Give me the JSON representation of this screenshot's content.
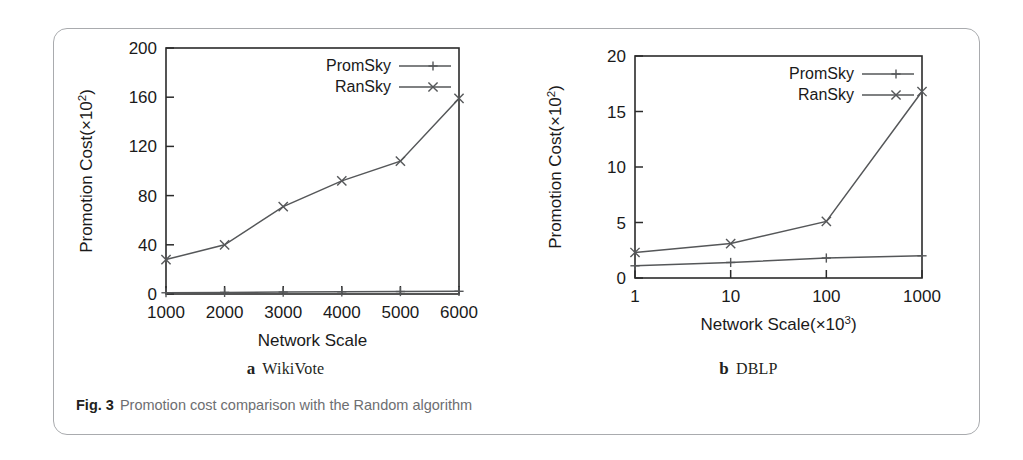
{
  "figure": {
    "caption_number": "Fig. 3",
    "caption_text": "Promotion cost comparison with the Random algorithm"
  },
  "panels": [
    {
      "sub_label": "a",
      "sub_name": "WikiVote"
    },
    {
      "sub_label": "b",
      "sub_name": "DBLP"
    }
  ],
  "chart_data": [
    {
      "type": "line",
      "title": "",
      "subfigure_label": "a",
      "subfigure_name": "WikiVote",
      "xlabel": "Network Scale",
      "ylabel": "Promotion Cost(×10²)",
      "ylabel_base": "Promotion Cost(×10",
      "ylabel_exp": "2",
      "ylabel_tail": ")",
      "x": [
        1000,
        2000,
        3000,
        4000,
        5000,
        6000
      ],
      "xticklabels": [
        "1000",
        "2000",
        "3000",
        "4000",
        "5000",
        "6000"
      ],
      "yticks": [
        0,
        40,
        80,
        120,
        160,
        200
      ],
      "yticklabels": [
        "0",
        "40",
        "80",
        "120",
        "160",
        "200"
      ],
      "xlim": [
        1000,
        6000
      ],
      "ylim": [
        0,
        200
      ],
      "grid": false,
      "legend_position": "top-right",
      "series": [
        {
          "name": "PromSky",
          "marker": "plus",
          "color": "#555759",
          "values": [
            1.0,
            1.3,
            1.6,
            1.8,
            2.0,
            2.2
          ]
        },
        {
          "name": "RanSky",
          "marker": "cross",
          "color": "#555759",
          "values": [
            28,
            40,
            71,
            92,
            108,
            159
          ]
        }
      ]
    },
    {
      "type": "line",
      "title": "",
      "subfigure_label": "b",
      "subfigure_name": "DBLP",
      "xlabel": "Network Scale(×10³)",
      "xlabel_base": "Network Scale(×10",
      "xlabel_exp": "3",
      "xlabel_tail": ")",
      "ylabel": "Promotion Cost(×10²)",
      "ylabel_base": "Promotion Cost(×10",
      "ylabel_exp": "2",
      "ylabel_tail": ")",
      "x": [
        1,
        10,
        100,
        1000
      ],
      "xticklabels": [
        "1",
        "10",
        "100",
        "1000"
      ],
      "yticks": [
        0,
        5,
        10,
        15,
        20
      ],
      "yticklabels": [
        "0",
        "5",
        "10",
        "15",
        "20"
      ],
      "xlim": [
        1,
        1000
      ],
      "xscale": "log",
      "ylim": [
        0,
        20
      ],
      "grid": false,
      "legend_position": "top-right",
      "series": [
        {
          "name": "PromSky",
          "marker": "plus",
          "color": "#555759",
          "values": [
            1.1,
            1.4,
            1.8,
            2.0
          ]
        },
        {
          "name": "RanSky",
          "marker": "cross",
          "color": "#555759",
          "values": [
            2.3,
            3.1,
            5.1,
            16.8
          ]
        }
      ]
    }
  ]
}
